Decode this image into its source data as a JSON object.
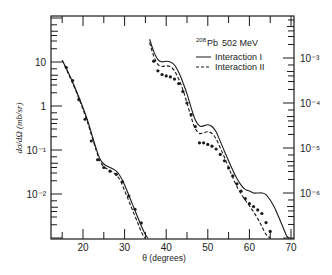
{
  "chart_data": {
    "type": "line",
    "title": "",
    "annotation": {
      "nucleus_mass": "208",
      "nucleus": "Pb",
      "energy": "502 MeV"
    },
    "xlabel": "θ (degrees)",
    "ylabel": "dσ/dΩ (mb/sr)",
    "xlim": [
      12.3,
      70.8
    ],
    "x_ticks": [
      20,
      30,
      40,
      50,
      60,
      70
    ],
    "x_tick_labels": [
      "20",
      "30",
      "40",
      "50",
      "60",
      "70"
    ],
    "left_y_axis": {
      "scale": "log",
      "ylim": [
        0.001,
        110
      ],
      "tick_labels": [
        "10",
        "1",
        "10⁻¹",
        "10⁻²"
      ],
      "tick_values": [
        10,
        1,
        0.1,
        0.01
      ]
    },
    "right_y_axis": {
      "scale": "log",
      "tick_labels": [
        "10⁻³",
        "10⁻⁴",
        "10⁻⁵",
        "10⁻⁶"
      ],
      "tick_values": [
        0.001,
        0.0001,
        1e-05,
        1e-06
      ]
    },
    "legend": [
      {
        "label": "Interaction I",
        "style": "solid"
      },
      {
        "label": "Interaction II",
        "style": "dashed"
      }
    ],
    "grid": false,
    "series": [
      {
        "name": "Interaction I (left scale)",
        "style": "solid",
        "x": [
          15,
          17,
          19,
          21,
          23,
          24,
          25,
          26,
          27,
          28,
          29,
          30,
          31,
          32,
          33,
          34,
          35,
          35.6
        ],
        "y": [
          11,
          4.5,
          1.6,
          0.5,
          0.12,
          0.065,
          0.048,
          0.042,
          0.038,
          0.033,
          0.025,
          0.016,
          0.0095,
          0.0055,
          0.0032,
          0.0019,
          0.0012,
          0.001
        ]
      },
      {
        "name": "Interaction II (left scale)",
        "style": "dashed",
        "x": [
          15,
          17,
          19,
          21,
          23,
          24,
          25,
          26,
          27,
          28,
          29,
          30,
          31,
          32,
          33,
          34,
          34.8
        ],
        "y": [
          11,
          4.2,
          1.5,
          0.45,
          0.11,
          0.058,
          0.042,
          0.036,
          0.032,
          0.027,
          0.02,
          0.012,
          0.007,
          0.0041,
          0.0024,
          0.0014,
          0.001
        ]
      },
      {
        "name": "Interaction I (right scale)",
        "style": "solid",
        "x": [
          36,
          37,
          38,
          39,
          40,
          41,
          42,
          43,
          44,
          45,
          46,
          47,
          48,
          49,
          50,
          51,
          52,
          53,
          54,
          55,
          56,
          57,
          58,
          59,
          60,
          61,
          62,
          63,
          64,
          65,
          66,
          67,
          68,
          69,
          69.6
        ],
        "y": [
          0.0026,
          0.0014,
          0.00092,
          0.00082,
          0.00085,
          0.00082,
          0.0007,
          0.00048,
          0.00029,
          0.00016,
          7.8e-05,
          4.2e-05,
          3.1e-05,
          3.1e-05,
          3.3e-05,
          3e-05,
          2.3e-05,
          1.4e-05,
          8.5e-06,
          5.2e-06,
          3.2e-06,
          2.1e-06,
          1.5e-06,
          1.2e-06,
          1.1e-06,
          1e-06,
          1e-06,
          1e-06,
          9.2e-07,
          7e-07,
          4.8e-07,
          3e-07,
          1.8e-07,
          1.1e-07,
          1e-07
        ]
      },
      {
        "name": "Interaction II (right scale)",
        "style": "dashed",
        "x": [
          36,
          37,
          38,
          39,
          40,
          41,
          42,
          43,
          44,
          45,
          46,
          47,
          48,
          49,
          50,
          51,
          52,
          53,
          54,
          55,
          56,
          57,
          58,
          59,
          60,
          61,
          62,
          63,
          64,
          65
        ],
        "y": [
          0.0022,
          0.0011,
          0.00072,
          0.00065,
          0.00067,
          0.00064,
          0.00052,
          0.00034,
          0.0002,
          0.0001,
          4.8e-05,
          2.7e-05,
          2.1e-05,
          2.2e-05,
          2.3e-05,
          2.1e-05,
          1.6e-05,
          1e-05,
          6.2e-06,
          3.7e-06,
          2.2e-06,
          1.4e-06,
          9.5e-07,
          7e-07,
          5.2e-07,
          3.8e-07,
          2.7e-07,
          1.8e-07,
          1.2e-07,
          1e-07
        ]
      },
      {
        "name": "Experimental data (left scale)",
        "style": "points",
        "x": [
          16,
          17.5,
          19,
          20.5,
          22,
          23.5,
          25,
          26.5,
          28,
          29.5,
          31,
          32.5,
          34
        ],
        "y": [
          7.5,
          3.8,
          1.4,
          0.5,
          0.16,
          0.06,
          0.04,
          0.033,
          0.028,
          0.019,
          0.009,
          0.0045,
          0.0022
        ]
      },
      {
        "name": "Experimental data (right scale)",
        "style": "points",
        "x": [
          37,
          38,
          39,
          40,
          41,
          42,
          43,
          44,
          45,
          46,
          47,
          48,
          49,
          50,
          51,
          52,
          53,
          54,
          55,
          56,
          57,
          58,
          59,
          60,
          61,
          62,
          63,
          64,
          65
        ],
        "y": [
          0.00085,
          0.00052,
          0.00043,
          0.0004,
          0.00038,
          0.00034,
          0.00027,
          0.00018,
          0.0001,
          5.5e-05,
          3e-05,
          1.3e-05,
          1.3e-05,
          1.2e-05,
          1.1e-05,
          9.5e-06,
          7.2e-06,
          5.2e-06,
          3.6e-06,
          2.4e-06,
          1.6e-06,
          1.1e-06,
          7.5e-07,
          5.8e-07,
          5e-07,
          4.2e-07,
          3.5e-07,
          2.2e-07,
          1.4e-07
        ]
      }
    ]
  }
}
